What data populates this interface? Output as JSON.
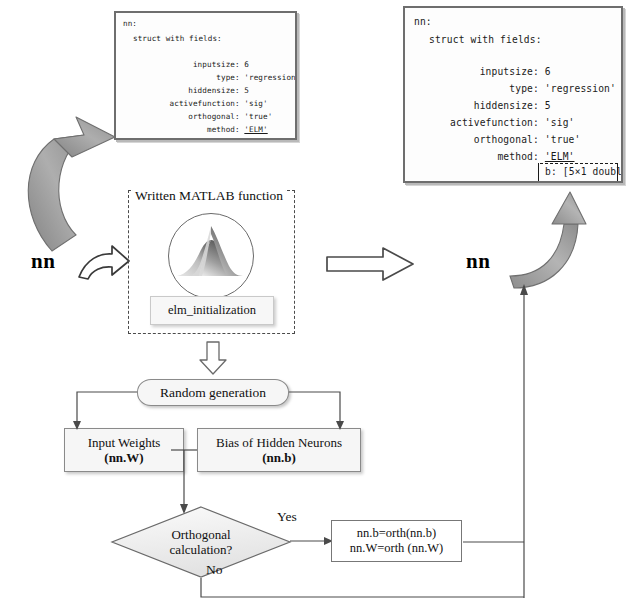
{
  "diagram": {
    "colors": {
      "background": "#ffffff",
      "panel_border": "#6e6e6e",
      "panel_fill": "#fdfdfd",
      "flow_fill": "#f6f6f6",
      "flow_border": "#8a8a8a",
      "gray_arrow": "#9a9a9a",
      "text": "#111111"
    }
  },
  "console_left": {
    "name": "nn-struct-before",
    "lines": [
      "nn:",
      "  struct with fields:",
      "",
      "          inputsize: 6",
      "               type: 'regression'",
      "         hiddensize: 5",
      "    activefunction: 'sig'",
      "        orthogonal: 'true'",
      "            method: 'ELM'"
    ],
    "fields": [
      {
        "key": "inputsize",
        "value": "6"
      },
      {
        "key": "type",
        "value": "'regression'"
      },
      {
        "key": "hiddensize",
        "value": "5"
      },
      {
        "key": "activefunction",
        "value": "'sig'"
      },
      {
        "key": "orthogonal",
        "value": "'true'"
      },
      {
        "key": "method",
        "value": "'ELM'"
      }
    ],
    "header": "nn:",
    "subheader": "struct with fields:"
  },
  "console_right": {
    "name": "nn-struct-after",
    "header": "nn:",
    "subheader": "struct with fields:",
    "fields": [
      {
        "key": "inputsize",
        "value": "6"
      },
      {
        "key": "type",
        "value": "'regression'"
      },
      {
        "key": "hiddensize",
        "value": "5"
      },
      {
        "key": "activefunction",
        "value": "'sig'"
      },
      {
        "key": "orthogonal",
        "value": "'true'"
      },
      {
        "key": "method",
        "value": "'ELM'"
      }
    ],
    "new_fields": [
      {
        "key": "b",
        "value": "[5×1 double]"
      },
      {
        "key": "W",
        "value": "[5×6 double]"
      }
    ]
  },
  "matlab_block": {
    "label": "Written MATLAB function",
    "logo_name": "matlab-membrane-logo",
    "function_name": "elm_initialization"
  },
  "flow": {
    "random_generation": "Random generation",
    "input_weights": {
      "line1": "Input Weights",
      "line2": "(nn.W)"
    },
    "bias_neurons": {
      "line1": "Bias of Hidden Neurons",
      "line2": "(nn.b)"
    },
    "decision": {
      "line1": "Orthogonal",
      "line2": "calculation?"
    },
    "yes_label": "Yes",
    "no_label": "No",
    "orth_box": {
      "line1": "nn.b=orth(nn.b)",
      "line2": "nn.W=orth (nn.W)"
    }
  },
  "labels": {
    "nn_input": "nn",
    "nn_output": "nn"
  },
  "arrows": {
    "gray_curve_up_left": "curved-gray-arrow-up-left",
    "white_block_right_small": "white-block-arrow-right",
    "white_block_right_big": "white-block-arrow-right-large",
    "gray_curve_up_right": "curved-gray-arrow-up-right",
    "white_block_down": "white-block-arrow-down"
  }
}
